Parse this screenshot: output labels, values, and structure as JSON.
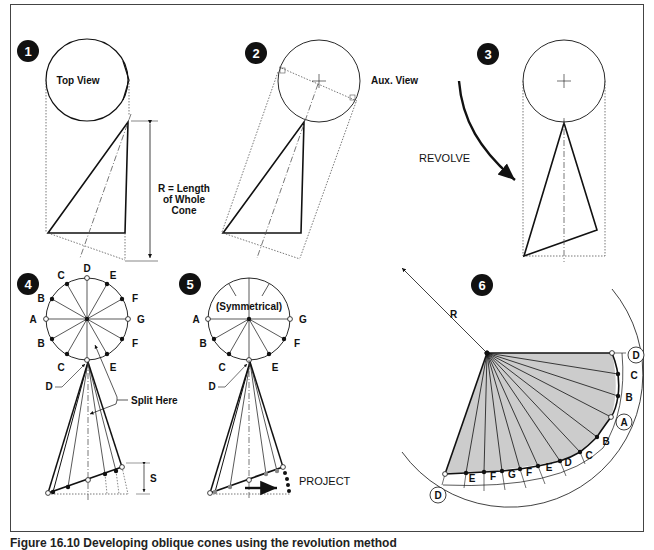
{
  "figure": {
    "caption": "Figure 16.10 Developing oblique cones using the revolution method",
    "steps": [
      {
        "number": "1",
        "labels": {
          "top_view": "Top View",
          "r_label_line1": "R = Length",
          "r_label_line2": "of Whole",
          "r_label_line3": "Cone"
        }
      },
      {
        "number": "2",
        "labels": {
          "aux_view": "Aux. View"
        }
      },
      {
        "number": "3",
        "labels": {
          "revolve": "REVOLVE"
        }
      },
      {
        "number": "4",
        "labels": {
          "split_here": "Split Here",
          "s": "S",
          "points": {
            "A": "A",
            "B": "B",
            "C": "C",
            "D": "D",
            "E": "E",
            "F": "F",
            "G": "G"
          }
        }
      },
      {
        "number": "5",
        "labels": {
          "symmetrical": "(Symmetrical)",
          "project": "PROJECT",
          "points": {
            "A": "A",
            "B": "B",
            "C": "C",
            "D": "D",
            "E": "E",
            "F": "F",
            "G": "G"
          }
        }
      },
      {
        "number": "6",
        "labels": {
          "r": "R",
          "edge_points": [
            "D",
            "C",
            "B",
            "A",
            "B",
            "C",
            "D",
            "E",
            "F",
            "G",
            "F",
            "E",
            "D"
          ]
        }
      }
    ]
  },
  "colors": {
    "line": "#111111",
    "fill_pattern": "#cccccc",
    "badge": "#111111",
    "frame": "#444444"
  }
}
